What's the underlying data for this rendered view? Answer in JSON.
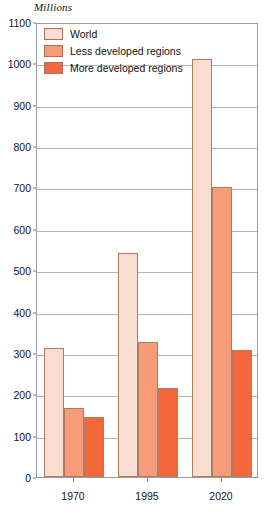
{
  "chart_data": {
    "type": "bar",
    "title": "",
    "unit_caption": "Millions",
    "xlabel": "",
    "ylabel": "Millions",
    "categories": [
      "1970",
      "1995",
      "2020"
    ],
    "ylim": [
      0,
      1100
    ],
    "ytick_step": 100,
    "yticks": [
      0,
      100,
      200,
      300,
      400,
      500,
      600,
      700,
      800,
      900,
      1000,
      1100
    ],
    "ytick_labels": [
      "0",
      "100",
      "200",
      "300",
      "400",
      "500",
      "600",
      "700",
      "800",
      "900",
      "1000",
      "1100"
    ],
    "grid": true,
    "legend_position": "top-left",
    "series": [
      {
        "name": "World",
        "color": "#f7ded0",
        "values": [
          312,
          542,
          1010
        ]
      },
      {
        "name": "Less developed regions",
        "color": "#f79b79",
        "values": [
          166,
          327,
          700
        ]
      },
      {
        "name": "More developed regions",
        "color": "#f4673a",
        "values": [
          146,
          215,
          306
        ]
      }
    ]
  },
  "legend": {
    "items": [
      {
        "label": "World"
      },
      {
        "label": "Less developed regions"
      },
      {
        "label": "More developed regions"
      }
    ]
  }
}
